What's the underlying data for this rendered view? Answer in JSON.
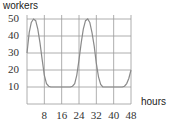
{
  "chart_data": {
    "type": "line",
    "title": "",
    "xlabel": "hours",
    "ylabel": "workers",
    "xlim": [
      0,
      48
    ],
    "ylim": [
      0,
      50
    ],
    "x_ticks": [
      "8",
      "16",
      "24",
      "32",
      "40",
      "48"
    ],
    "y_ticks": [
      "10",
      "20",
      "30",
      "40",
      "50"
    ],
    "grid": true,
    "series": [
      {
        "name": "workers",
        "x": [
          0,
          1,
          2,
          3,
          4,
          5,
          6,
          7,
          8,
          9,
          10,
          11,
          12,
          14,
          16,
          18,
          20,
          21,
          22,
          23,
          24,
          25,
          26,
          27,
          28,
          29,
          30,
          31,
          32,
          33,
          34,
          35,
          36,
          38,
          40,
          42,
          44,
          45,
          46,
          47,
          48
        ],
        "y": [
          30,
          42,
          48,
          50,
          49,
          44,
          36,
          26,
          17,
          12,
          10.5,
          10,
          10,
          10,
          10,
          10,
          10,
          10.5,
          12,
          17,
          26,
          36,
          44,
          49,
          50,
          48,
          42,
          34,
          24,
          16,
          11.5,
          10,
          10,
          10,
          10,
          10,
          10,
          10.5,
          12,
          15,
          20
        ]
      }
    ],
    "color": "#888888"
  },
  "labels": {
    "ylabel": "workers",
    "xlabel": "hours",
    "y_ticks": [
      "50",
      "40",
      "30",
      "20",
      "10"
    ],
    "x_ticks": [
      "8",
      "16",
      "24",
      "32",
      "40",
      "48"
    ]
  }
}
